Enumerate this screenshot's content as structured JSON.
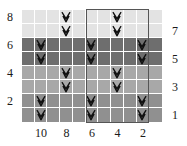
{
  "chart": {
    "columns": 11,
    "rows": 8,
    "symbol_name": "slip-stitch-v",
    "row_labels_left": [
      "8",
      "6",
      "4",
      "2"
    ],
    "row_labels_right": [
      "7",
      "5",
      "3",
      "1"
    ],
    "column_labels": [
      "10",
      "8",
      "6",
      "4",
      "2"
    ],
    "colors": {
      "band_rows_8_7": "#e3e3e3",
      "band_rows_6_5": "#6e6e6e",
      "band_rows_4_3": "#a8a8a8",
      "band_rows_2_1": "#909090",
      "grid_line": "#ffffff",
      "symbol": "#101010",
      "repeat_box": "#555555",
      "label_text": "#1a1a1a",
      "background": "#ffffff"
    },
    "repeat": {
      "label": "pattern repeat",
      "start_column": 6,
      "end_column": 2,
      "width_columns": 4
    },
    "rows_data": [
      {
        "row": 8,
        "side": "even",
        "shade": "#e3e3e3",
        "symbol_columns": [
          8,
          4
        ]
      },
      {
        "row": 7,
        "side": "odd",
        "shade": "#e3e3e3",
        "symbol_columns": [
          8,
          4
        ]
      },
      {
        "row": 6,
        "side": "even",
        "shade": "#6e6e6e",
        "symbol_columns": [
          10,
          6,
          2
        ]
      },
      {
        "row": 5,
        "side": "odd",
        "shade": "#6e6e6e",
        "symbol_columns": [
          10,
          6,
          2
        ]
      },
      {
        "row": 4,
        "side": "even",
        "shade": "#a8a8a8",
        "symbol_columns": [
          8,
          4
        ]
      },
      {
        "row": 3,
        "side": "odd",
        "shade": "#a8a8a8",
        "symbol_columns": [
          8,
          4
        ]
      },
      {
        "row": 2,
        "side": "even",
        "shade": "#909090",
        "symbol_columns": [
          10,
          6,
          2
        ]
      },
      {
        "row": 1,
        "side": "odd",
        "shade": "#909090",
        "symbol_columns": [
          10,
          6,
          2
        ]
      }
    ]
  }
}
